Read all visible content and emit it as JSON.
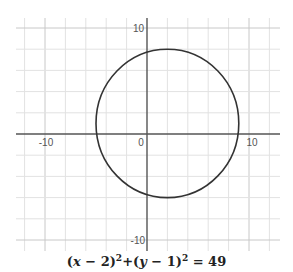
{
  "chart_data": {
    "type": "line",
    "title": "",
    "caption": "(x − 2)²+(y − 1)² = 49",
    "xlabel": "",
    "ylabel": "",
    "xlim": [
      -12.5,
      13
    ],
    "ylim": [
      -11.5,
      11
    ],
    "grid": true,
    "grid_step": 2,
    "x_ticks": [
      {
        "value": -10,
        "label": "-10"
      },
      {
        "value": 0,
        "label": "0"
      },
      {
        "value": 10,
        "label": "10"
      }
    ],
    "y_ticks": [
      {
        "value": 10,
        "label": "10"
      },
      {
        "value": -10,
        "label": "-10"
      }
    ],
    "series": [
      {
        "name": "circle",
        "shape": "circle",
        "center": [
          2,
          1
        ],
        "radius": 7,
        "color": "#333333"
      }
    ]
  },
  "labels": {
    "x_neg10": "-10",
    "origin": "0",
    "x_pos10": "10",
    "y_pos10": "10",
    "y_neg10": "-10"
  },
  "equation": {
    "lhs1_open": "(",
    "var_x": "x",
    "lhs1_rest": " − 2)",
    "exp1": "2",
    "plus": "+(",
    "var_y": "y",
    "lhs2_rest": " − 1)",
    "exp2": "2",
    "rhs": " = 49"
  }
}
